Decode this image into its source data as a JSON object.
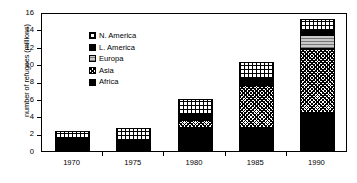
{
  "chart_data": {
    "type": "bar",
    "title": "",
    "subtitle": "",
    "xlabel": "",
    "ylabel": "number of refugees (millions)",
    "categories": [
      "1970",
      "1975",
      "1980",
      "1985",
      "1990"
    ],
    "ylim": [
      0,
      16
    ],
    "yticks": [
      0,
      2,
      4,
      6,
      8,
      10,
      12,
      14,
      16
    ],
    "grid": false,
    "stacked": true,
    "legend_position": "top-left",
    "series": [
      {
        "name": "Africa",
        "pattern": "solid-black",
        "values": [
          1.4,
          1.2,
          2.6,
          2.6,
          4.4
        ]
      },
      {
        "name": "Asia",
        "pattern": "crosshatch",
        "values": [
          0.0,
          0.0,
          1.0,
          5.0,
          7.4
        ]
      },
      {
        "name": "Europa",
        "pattern": "gray-dotted",
        "values": [
          0.0,
          0.0,
          0.2,
          0.0,
          1.6
        ]
      },
      {
        "name": "L. America",
        "pattern": "solid-black",
        "values": [
          0.0,
          0.0,
          0.3,
          0.7,
          0.4
        ]
      },
      {
        "name": "N. America",
        "pattern": "grid",
        "values": [
          0.9,
          1.4,
          1.9,
          2.0,
          1.4
        ]
      }
    ],
    "totals": [
      2.3,
      2.6,
      6.0,
      10.3,
      15.2
    ]
  },
  "legend": {
    "items": [
      {
        "label": "N. America",
        "pattern": "grid"
      },
      {
        "label": "L. America",
        "pattern": "solid-black"
      },
      {
        "label": "Europa",
        "pattern": "gray-dotted"
      },
      {
        "label": "Asia",
        "pattern": "crosshatch"
      },
      {
        "label": "Africa",
        "pattern": "solid-black"
      }
    ]
  }
}
